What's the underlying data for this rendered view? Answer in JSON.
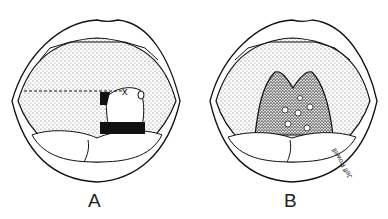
{
  "figure": {
    "panels": [
      {
        "id": "A",
        "label": "A",
        "marker": "x"
      },
      {
        "id": "B",
        "label": "B"
      }
    ],
    "signature": "Jeff Powell"
  }
}
